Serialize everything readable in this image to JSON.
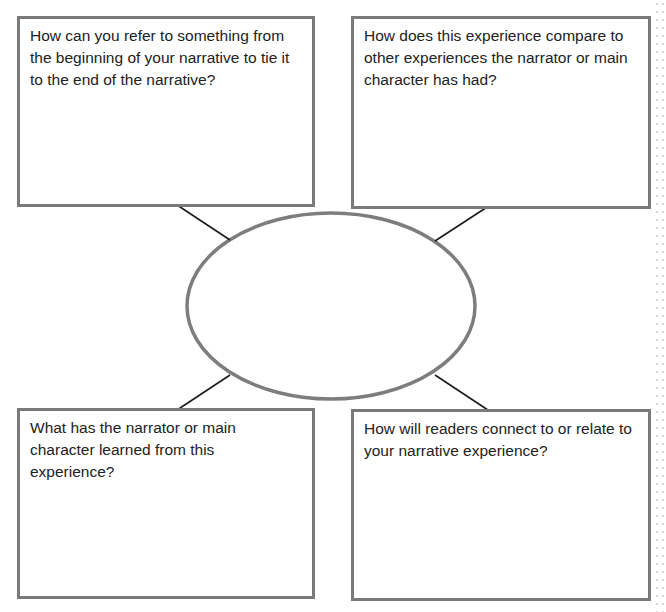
{
  "diagram": {
    "center_label": "",
    "boxes": {
      "top_left": {
        "prompt": "How can you refer to something from the beginning of your narrative to tie it to the end of the narrative?"
      },
      "top_right": {
        "prompt": "How does this experience compare to other experiences the narrator or main character has had?"
      },
      "bottom_left": {
        "prompt": "What has the narrator or main character learned from this experience?"
      },
      "bottom_right": {
        "prompt": "How will readers connect to or relate to your narrative experience?"
      }
    },
    "colors": {
      "box_border": "#7a7a7a",
      "ellipse_border": "#7d7d7d",
      "arrow": "#1a1a1a",
      "text": "#222222"
    }
  }
}
